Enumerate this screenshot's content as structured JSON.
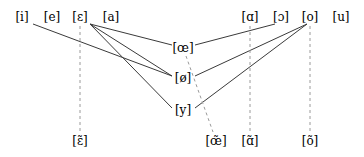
{
  "diagram": {
    "type": "graph",
    "canvas": {
      "width": 364,
      "height": 157
    },
    "colors": {
      "background": "#ffffff",
      "node_text": "#000000",
      "solid_edge": "#3a3a3a",
      "dashed_edge": "#9a9a9a"
    },
    "nodes": [
      {
        "id": "i",
        "label": "[i]",
        "x": 22,
        "y": 17,
        "row": "top"
      },
      {
        "id": "e",
        "label": "[e]",
        "x": 52,
        "y": 17,
        "row": "top"
      },
      {
        "id": "eps",
        "label": "[ɛ]",
        "x": 80,
        "y": 17,
        "row": "top"
      },
      {
        "id": "a",
        "label": "[a]",
        "x": 111,
        "y": 17,
        "row": "top"
      },
      {
        "id": "scripta",
        "label": "[ɑ]",
        "x": 250,
        "y": 17,
        "row": "top"
      },
      {
        "id": "openo",
        "label": "[ɔ]",
        "x": 281,
        "y": 17,
        "row": "top"
      },
      {
        "id": "o",
        "label": "[o]",
        "x": 310,
        "y": 17,
        "row": "top"
      },
      {
        "id": "u",
        "label": "[u]",
        "x": 341,
        "y": 17,
        "row": "top"
      },
      {
        "id": "oe",
        "label": "[œ]",
        "x": 183,
        "y": 48,
        "row": "middle"
      },
      {
        "id": "oslash",
        "label": "[ø]",
        "x": 183,
        "y": 78,
        "row": "middle"
      },
      {
        "id": "y",
        "label": "[y]",
        "x": 183,
        "y": 110,
        "row": "middle"
      },
      {
        "id": "epsnas",
        "label": "[ɛ̃]",
        "x": 80,
        "y": 141,
        "row": "bottom"
      },
      {
        "id": "oenas",
        "label": "[œ̃]",
        "x": 216,
        "y": 141,
        "row": "bottom"
      },
      {
        "id": "anas",
        "label": "[ɑ̃]",
        "x": 250,
        "y": 141,
        "row": "bottom"
      },
      {
        "id": "onas",
        "label": "[õ]",
        "x": 310,
        "y": 141,
        "row": "bottom"
      }
    ],
    "edges": [
      {
        "from": "i",
        "to": "oslash",
        "style": "solid",
        "x1": 33,
        "y1": 24,
        "x2": 172,
        "y2": 76
      },
      {
        "from": "eps",
        "to": "oe",
        "style": "solid",
        "x1": 90,
        "y1": 24,
        "x2": 172,
        "y2": 45
      },
      {
        "from": "eps",
        "to": "oslash",
        "style": "solid",
        "x1": 90,
        "y1": 24,
        "x2": 172,
        "y2": 76
      },
      {
        "from": "eps",
        "to": "y",
        "style": "solid",
        "x1": 90,
        "y1": 24,
        "x2": 172,
        "y2": 108
      },
      {
        "from": "openo",
        "to": "oe",
        "style": "solid",
        "x1": 275,
        "y1": 24,
        "x2": 195,
        "y2": 45
      },
      {
        "from": "o",
        "to": "oslash",
        "style": "solid",
        "x1": 307,
        "y1": 24,
        "x2": 195,
        "y2": 76
      },
      {
        "from": "o",
        "to": "y",
        "style": "solid",
        "x1": 307,
        "y1": 24,
        "x2": 195,
        "y2": 108
      },
      {
        "from": "eps",
        "to": "epsnas",
        "style": "dashed",
        "x1": 80,
        "y1": 26,
        "x2": 80,
        "y2": 132
      },
      {
        "from": "oe",
        "to": "oenas",
        "style": "dashed",
        "x1": 186,
        "y1": 56,
        "x2": 213,
        "y2": 132
      },
      {
        "from": "scripta",
        "to": "anas",
        "style": "dashed",
        "x1": 250,
        "y1": 26,
        "x2": 250,
        "y2": 132
      },
      {
        "from": "o",
        "to": "onas",
        "style": "dashed",
        "x1": 310,
        "y1": 26,
        "x2": 310,
        "y2": 132
      }
    ]
  }
}
